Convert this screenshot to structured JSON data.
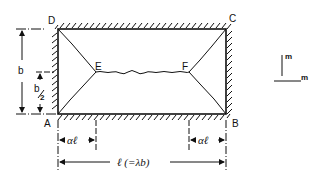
{
  "diagram": {
    "type": "yield-line pattern of rectangular slab with fixed edges",
    "corners": {
      "D": "D",
      "C": "C",
      "A": "A",
      "B": "B"
    },
    "inner_points": {
      "E": "E",
      "F": "F"
    },
    "dimensions": {
      "height": "b",
      "half_height_num": "b",
      "half_height_den": "2",
      "left_offset": "αℓ",
      "right_offset": "αℓ",
      "length": "ℓ (=λb)"
    },
    "moment_legend": {
      "vertical": "m",
      "horizontal": "m"
    },
    "colors": {
      "line": "#111111",
      "background": "#ffffff"
    }
  }
}
